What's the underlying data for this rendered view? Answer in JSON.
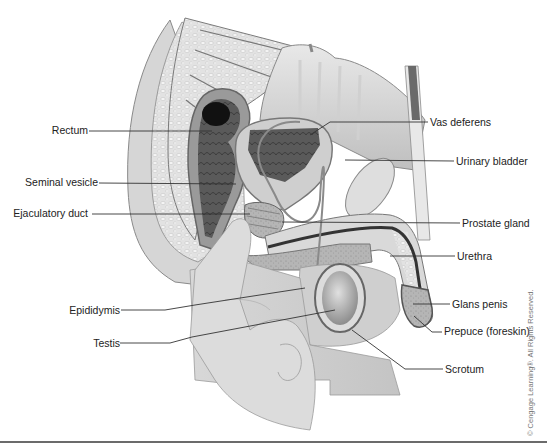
{
  "diagram": {
    "labels_left": [
      {
        "id": "rectum",
        "text": "Rectum"
      },
      {
        "id": "seminal-vesicle",
        "text": "Seminal vesicle"
      },
      {
        "id": "ejaculatory-duct",
        "text": "Ejaculatory duct"
      },
      {
        "id": "epididymis",
        "text": "Epididymis"
      },
      {
        "id": "testis",
        "text": "Testis"
      }
    ],
    "labels_right": [
      {
        "id": "vas-deferens",
        "text": "Vas deferens"
      },
      {
        "id": "urinary-bladder",
        "text": "Urinary bladder"
      },
      {
        "id": "prostate-gland",
        "text": "Prostate gland"
      },
      {
        "id": "urethra",
        "text": "Urethra"
      },
      {
        "id": "glans-penis",
        "text": "Glans penis"
      },
      {
        "id": "prepuce",
        "text": "Prepuce (foreskin)"
      },
      {
        "id": "scrotum",
        "text": "Scrotum"
      }
    ],
    "copyright": "© Cengage Learning®. All Rights Reserved."
  },
  "colors": {
    "background": "#ffffff",
    "tissue_light": "#e4e4e4",
    "tissue_mid": "#bdbdbd",
    "tissue_dark": "#6e6e6e",
    "cavity_dark": "#1a1a1a",
    "leader_line": "#333333",
    "label_text": "#222222",
    "rule": "#6b6b6b"
  }
}
